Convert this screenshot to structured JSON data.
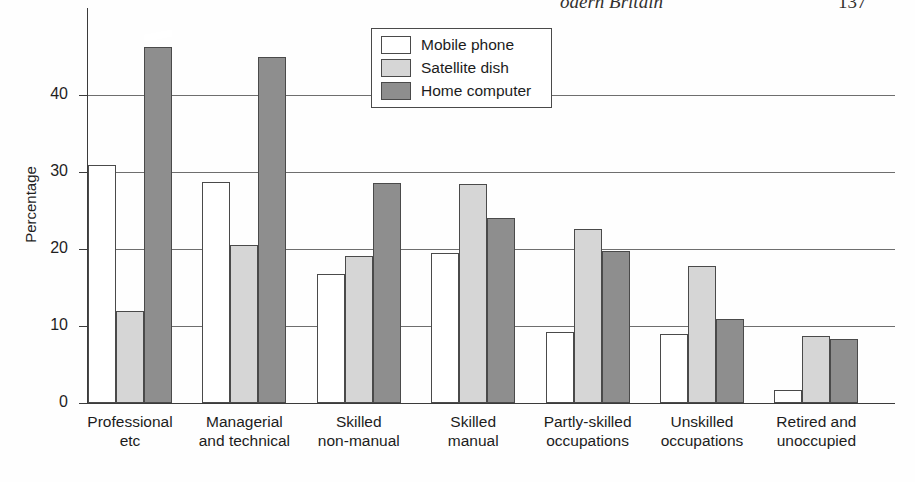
{
  "page_header": {
    "title": "odern Britain",
    "page_number": "137"
  },
  "legend": {
    "position": "top-center-right",
    "items": [
      {
        "label": "Mobile phone",
        "key": "mobile",
        "color": "#ffffff",
        "swatch_name": "legend-swatch-mobile-phone"
      },
      {
        "label": "Satellite dish",
        "key": "satellite",
        "color": "#d6d6d6",
        "swatch_name": "legend-swatch-satellite-dish"
      },
      {
        "label": "Home computer",
        "key": "home",
        "color": "#8e8e8e",
        "swatch_name": "legend-swatch-home-computer"
      }
    ]
  },
  "axes": {
    "ylabel": "Percentage",
    "yticks": [
      "0",
      "10",
      "20",
      "30",
      "40"
    ],
    "ylim": [
      0,
      48
    ],
    "grid": "horizontal gridlines at 10, 20, 30, 40",
    "note": "first Home computer bar is clipped with an axis-break slash"
  },
  "chart_data": {
    "type": "bar",
    "title": "",
    "xlabel": "",
    "ylabel": "Percentage",
    "ylim": [
      0,
      48
    ],
    "yticks": [
      0,
      10,
      20,
      30,
      40
    ],
    "grid": true,
    "legend_position": "top-center-right",
    "categories": [
      "Professional\netc",
      "Managerial\nand technical",
      "Skilled\nnon-manual",
      "Skilled\nmanual",
      "Partly-skilled\noccupations",
      "Unskilled\noccupations",
      "Retired and\nunoccupied"
    ],
    "category_lines": [
      [
        "Professional",
        "etc"
      ],
      [
        "Managerial",
        "and technical"
      ],
      [
        "Skilled",
        "non-manual"
      ],
      [
        "Skilled",
        "manual"
      ],
      [
        "Partly-skilled",
        "occupations"
      ],
      [
        "Unskilled",
        "occupations"
      ],
      [
        "Retired and",
        "unoccupied"
      ]
    ],
    "series": [
      {
        "name": "Mobile phone",
        "color": "#ffffff",
        "values": [
          32.0,
          29.8,
          17.8,
          20.5,
          10.3,
          10.0,
          2.7
        ]
      },
      {
        "name": "Satellite dish",
        "color": "#d6d6d6",
        "values": [
          13.0,
          21.5,
          20.1,
          29.5,
          23.7,
          18.8,
          9.8
        ]
      },
      {
        "name": "Home computer",
        "color": "#8e8e8e",
        "values": [
          47.3,
          46.0,
          29.6,
          25.1,
          20.8,
          11.9,
          9.3
        ]
      }
    ],
    "annotations": [
      {
        "type": "axis-break",
        "series": "Home computer",
        "category": "Professional etc"
      }
    ]
  }
}
